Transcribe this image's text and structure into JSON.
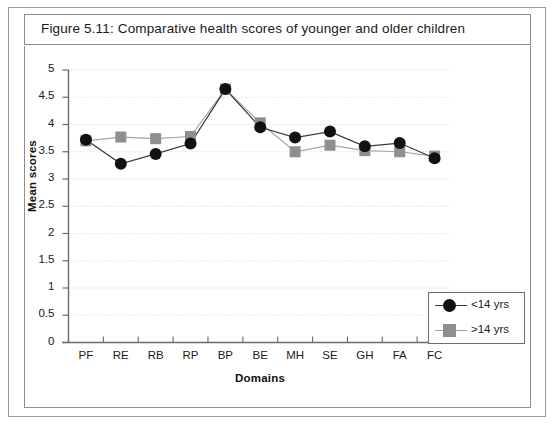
{
  "figure": {
    "title": "Figure 5.11:  Comparative health scores of younger and older children"
  },
  "chart_data": {
    "type": "line",
    "title": "Comparative health scores of younger and older children",
    "xlabel": "Domains",
    "ylabel": "Mean scores",
    "categories": [
      "PF",
      "RE",
      "RB",
      "RP",
      "BP",
      "BE",
      "MH",
      "SE",
      "GH",
      "FA",
      "FC"
    ],
    "series": [
      {
        "name": "<14 yrs",
        "marker": "circle",
        "color": "#111111",
        "line_color": "#3a3a3a",
        "values": [
          3.72,
          3.28,
          3.46,
          3.65,
          4.65,
          3.95,
          3.76,
          3.87,
          3.6,
          3.66,
          3.38
        ]
      },
      {
        "name": ">14 yrs",
        "marker": "square",
        "color": "#8f8f8f",
        "line_color": "#a5a5a5",
        "values": [
          3.7,
          3.77,
          3.74,
          3.78,
          4.65,
          4.03,
          3.5,
          3.62,
          3.52,
          3.5,
          3.42
        ]
      }
    ],
    "ylim": [
      0,
      5
    ],
    "yticks": [
      "0",
      "0.5",
      "1",
      "1.5",
      "2",
      "2.5",
      "3",
      "3.5",
      "4",
      "4.5",
      "5"
    ],
    "ytick_values": [
      0,
      0.5,
      1,
      1.5,
      2,
      2.5,
      3,
      3.5,
      4,
      4.5,
      5
    ],
    "grid": true,
    "grid_style": "dotted-horizontal",
    "legend_position": "bottom-right"
  },
  "legend": {
    "items": [
      {
        "label": "<14 yrs",
        "marker": "circle"
      },
      {
        "label": ">14 yrs",
        "marker": "square"
      }
    ]
  },
  "colors": {
    "series_young": "#111111",
    "series_old": "#8f8f8f",
    "grid": "#d2d2d2",
    "axis": "#6a6a6a",
    "frame": "#9a9a9a"
  }
}
